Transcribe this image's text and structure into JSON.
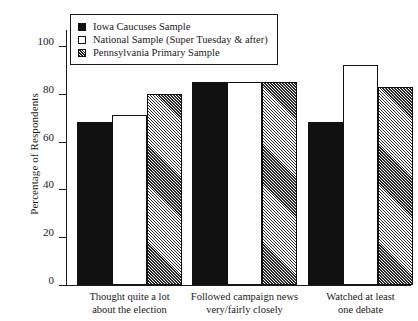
{
  "chart_data": {
    "type": "bar",
    "title": "",
    "subtitle": "",
    "xlabel": "",
    "ylabel": "Percentage of Respondents",
    "ylim": [
      0,
      100
    ],
    "yticks": [
      0,
      20,
      40,
      60,
      80,
      100
    ],
    "grid": false,
    "legend_position": "top-left inside plot",
    "categories": [
      "Thought quite a lot\nabout the election",
      "Followed campaign news\nvery/fairly closely",
      "Watched at least\none debate"
    ],
    "series": [
      {
        "name": "Iowa Caucuses Sample",
        "style": "solid-black",
        "values": [
          68,
          85,
          68
        ]
      },
      {
        "name": "National Sample (Super Tuesday & after)",
        "style": "open-white",
        "values": [
          71,
          85,
          92
        ]
      },
      {
        "name": "Pennsylvania Primary Sample",
        "style": "hatched",
        "values": [
          80,
          85,
          83
        ]
      }
    ]
  },
  "legend": {
    "items": [
      {
        "label": "Iowa Caucuses Sample",
        "swatch": "solid-square-icon"
      },
      {
        "label": "National Sample (Super Tuesday & after)",
        "swatch": "open-square-icon"
      },
      {
        "label": "Pennsylvania Primary Sample",
        "swatch": "hatched-square-icon"
      }
    ]
  },
  "axes": {
    "y_title": "Percentage of Respondents",
    "y_tick_labels": [
      "0",
      "20",
      "40",
      "60",
      "80",
      "100"
    ],
    "x_tick_labels": [
      "Thought quite a lot\nabout the election",
      "Followed campaign news\nvery/fairly closely",
      "Watched at least\none debate"
    ]
  },
  "colors": {
    "ink": "#1a1a1a",
    "bar_solid": "#111111",
    "bar_open": "#ffffff",
    "bar_hatch_line": "#2b2b2b",
    "background": "#ffffff"
  }
}
